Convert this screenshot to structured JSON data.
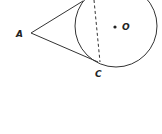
{
  "diagram": {
    "type": "geometry",
    "points": {
      "A": {
        "label": "A",
        "x": 31,
        "y": 33
      },
      "C": {
        "label": "C",
        "x": 98,
        "y": 62
      },
      "O": {
        "label": "O",
        "x": 115,
        "y": 27
      }
    },
    "circle": {
      "cx": 116,
      "cy": 26,
      "r": 41
    },
    "colors": {
      "stroke": "#333333",
      "background": "#ffffff"
    }
  }
}
